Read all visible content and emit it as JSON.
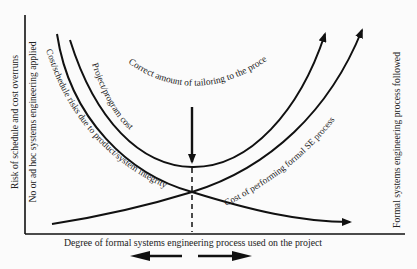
{
  "diagram": {
    "type": "cost-vs-formality tradeoff curves",
    "axes": {
      "x_label": "Degree of formal systems engineering process used on the project",
      "y_label": "Risk of schedule and cost overruns",
      "left_extreme_label": "No or ad hoc systems engineering applied",
      "right_extreme_label": "Formal systems engineering process followed"
    },
    "curves": [
      {
        "id": "risk",
        "label": "Cost/schedule risks due to product/system integrity",
        "shape": "decreasing"
      },
      {
        "id": "total",
        "label": "Project/program cost",
        "shape": "U-shaped"
      },
      {
        "id": "se-cost",
        "label": "Cost of performing formal SE process",
        "shape": "increasing"
      }
    ],
    "annotation": {
      "optimum_label": "Correct amount of tailoring to the process"
    },
    "direction_arrows": [
      "left",
      "right"
    ]
  },
  "colors": {
    "ink": "#111111",
    "background": "#fbfbfb"
  }
}
